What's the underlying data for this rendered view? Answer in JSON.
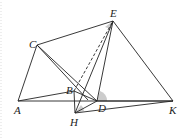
{
  "diagram": {
    "type": "geometry",
    "points": {
      "A": {
        "x": 18,
        "y": 101,
        "label": "A"
      },
      "B": {
        "x": 74,
        "y": 91,
        "label": "B"
      },
      "C": {
        "x": 37,
        "y": 45,
        "label": "C"
      },
      "D": {
        "x": 97,
        "y": 101,
        "label": "D"
      },
      "E": {
        "x": 113,
        "y": 21,
        "label": "E"
      },
      "H": {
        "x": 75,
        "y": 113,
        "label": "H"
      },
      "K": {
        "x": 173,
        "y": 101,
        "label": "K"
      }
    },
    "segments": [
      "AC",
      "AK",
      "AB",
      "CE",
      "CD",
      "CB",
      "EK",
      "ED",
      "EH",
      "DK",
      "HK",
      "HB",
      "BD",
      "CH"
    ],
    "dashed_segments": [
      "BE"
    ],
    "shaded_angles": [
      "E",
      "D",
      "H"
    ],
    "colors": {
      "line": "#222222",
      "shade": "#cccccc"
    }
  }
}
